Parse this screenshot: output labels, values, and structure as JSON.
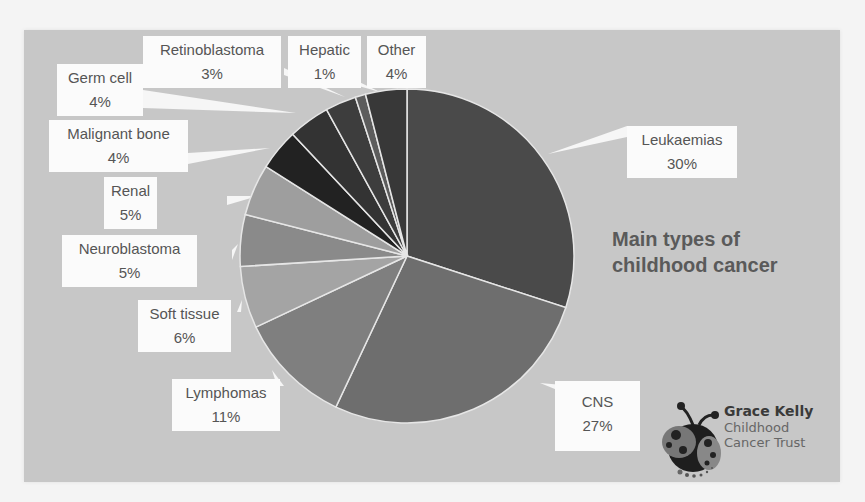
{
  "chart_data": {
    "type": "pie",
    "title": "Main types of childhood cancer",
    "categories": [
      "Leukaemias",
      "CNS",
      "Lymphomas",
      "Soft tissue",
      "Neuroblastoma",
      "Renal",
      "Malignant bone",
      "Germ cell",
      "Retinoblastoma",
      "Hepatic",
      "Other"
    ],
    "values": [
      30,
      27,
      11,
      6,
      5,
      5,
      4,
      4,
      3,
      1,
      4
    ],
    "units": "%",
    "start_angle": "12 o'clock, clockwise",
    "legend": "none (data callout labels)",
    "colors": [
      "#4a4a4a",
      "#6e6e6e",
      "#7f7f7f",
      "#a4a4a4",
      "#8a8a8a",
      "#9e9e9e",
      "#222222",
      "#333333",
      "#3d3d3d",
      "#5c5c5c",
      "#383838"
    ]
  },
  "title": {
    "line1": "Main types of",
    "line2": "childhood cancer"
  },
  "labels": [
    {
      "name": "Leukaemias",
      "pct": "30%"
    },
    {
      "name": "CNS",
      "pct": "27%"
    },
    {
      "name": "Lymphomas",
      "pct": "11%"
    },
    {
      "name": "Soft tissue",
      "pct": "6%"
    },
    {
      "name": "Neuroblastoma",
      "pct": "5%"
    },
    {
      "name": "Renal",
      "pct": "5%"
    },
    {
      "name": "Malignant bone",
      "pct": "4%"
    },
    {
      "name": "Germ cell",
      "pct": "4%"
    },
    {
      "name": "Retinoblastoma",
      "pct": "3%"
    },
    {
      "name": "Hepatic",
      "pct": "1%"
    },
    {
      "name": "Other",
      "pct": "4%"
    }
  ],
  "logo": {
    "line1": "Grace Kelly",
    "line2": "Childhood",
    "line3": "Cancer Trust"
  }
}
